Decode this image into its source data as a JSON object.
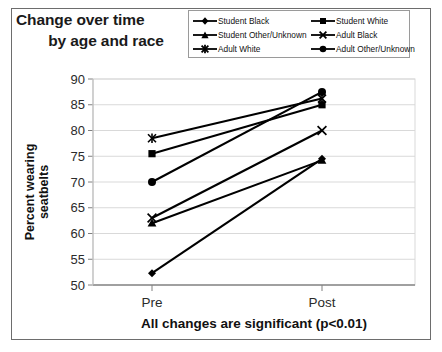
{
  "chart_data": {
    "type": "line",
    "title": "Change over time by age and race",
    "title_line1": "Change over time",
    "title_line2": "by age and race",
    "xlabel": "All changes are significant (p<0.01)",
    "ylabel": "Percent wearing seatbelts",
    "ylabel_line1": "Percent wearing",
    "ylabel_line2": "seatbelts",
    "categories": [
      "Pre",
      "Post"
    ],
    "ylim": [
      50,
      90
    ],
    "yticks": [
      50,
      55,
      60,
      65,
      70,
      75,
      80,
      85,
      90
    ],
    "grid": true,
    "legend_position": "top-right",
    "series": [
      {
        "name": "Student Black",
        "marker": "diamond",
        "values": [
          52.3,
          74.5
        ]
      },
      {
        "name": "Student White",
        "marker": "square",
        "values": [
          75.5,
          85.0
        ]
      },
      {
        "name": "Student Other/Unknown",
        "marker": "triangle",
        "values": [
          62.0,
          74.2
        ]
      },
      {
        "name": "Adult Black",
        "marker": "x",
        "values": [
          63.0,
          80.0
        ]
      },
      {
        "name": "Adult White",
        "marker": "asterisk",
        "values": [
          78.5,
          86.2
        ]
      },
      {
        "name": "Adult Other/Unknown",
        "marker": "circle",
        "values": [
          70.0,
          87.5
        ]
      }
    ]
  },
  "legend": {
    "items": [
      {
        "label": "Student Black",
        "marker": "diamond"
      },
      {
        "label": "Student White",
        "marker": "square"
      },
      {
        "label": "Student Other/Unknown",
        "marker": "triangle"
      },
      {
        "label": "Adult Black",
        "marker": "x"
      },
      {
        "label": "Adult White",
        "marker": "asterisk"
      },
      {
        "label": "Adult Other/Unknown",
        "marker": "circle"
      }
    ]
  },
  "colors": {
    "series": "#000000",
    "grid": "#d9d9d9",
    "axis": "#808080",
    "frame": "#6d6d6d",
    "text": "#1a1a1a",
    "background": "#ffffff"
  }
}
